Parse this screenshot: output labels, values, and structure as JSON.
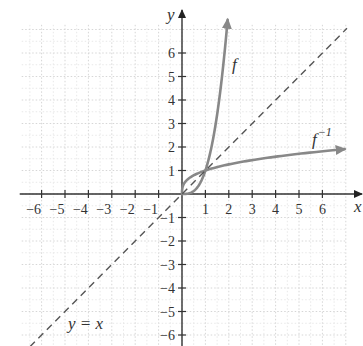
{
  "chart_data": {
    "type": "line",
    "title": "",
    "xlabel": "x",
    "ylabel": "y",
    "xlim": [
      -6.85,
      7.05
    ],
    "ylim": [
      -6.5,
      7.2
    ],
    "grid": true,
    "x_ticks": [
      -6,
      -5,
      -4,
      -3,
      -2,
      -1,
      1,
      2,
      3,
      4,
      5,
      6
    ],
    "y_ticks": [
      -6,
      -5,
      -4,
      -3,
      -2,
      -1,
      1,
      2,
      3,
      4,
      5,
      6
    ],
    "x_tick_labels": [
      "−6",
      "−5",
      "−4",
      "−3",
      "−2",
      "−1",
      "1",
      "2",
      "3",
      "4",
      "5",
      "6"
    ],
    "y_tick_labels": [
      "−6",
      "−5",
      "−4",
      "−3",
      "−2",
      "−1",
      "1",
      "2",
      "3",
      "4",
      "5",
      "6"
    ],
    "series": [
      {
        "name": "f",
        "label": "f",
        "style": "solid",
        "color": "#888888",
        "arrow_end": true,
        "x": [
          0,
          0.25,
          0.5,
          0.75,
          1,
          1.25,
          1.5,
          1.75,
          1.95
        ],
        "y": [
          0,
          0.016,
          0.125,
          0.42,
          1,
          1.95,
          3.375,
          5.36,
          7.1
        ]
      },
      {
        "name": "f_inverse",
        "label": "f",
        "label_sup": "−1",
        "style": "solid",
        "color": "#888888",
        "arrow_end": true,
        "x": [
          0,
          0.016,
          0.125,
          0.42,
          1,
          2,
          3,
          4,
          5,
          6,
          6.95
        ],
        "y": [
          0,
          0.25,
          0.5,
          0.75,
          1,
          1.26,
          1.44,
          1.59,
          1.71,
          1.82,
          1.91
        ]
      },
      {
        "name": "y = x",
        "label": "y = x",
        "style": "dashed",
        "color": "#555555",
        "x": [
          -6.5,
          7.05
        ],
        "y": [
          -6.5,
          7.05
        ]
      }
    ],
    "annotations": [
      {
        "text": "f",
        "x": 2.2,
        "y": 5.5
      },
      {
        "text": "f⁻¹",
        "x": 5.5,
        "y": 2.3
      },
      {
        "text": "y = x",
        "x": -4.5,
        "y": -5.9
      }
    ]
  },
  "labels": {
    "x_axis": "x",
    "y_axis": "y",
    "f": "f",
    "f_inv_base": "f",
    "f_inv_sup": "−1",
    "identity": "y = x"
  }
}
